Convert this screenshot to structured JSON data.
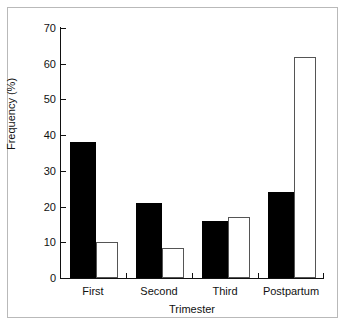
{
  "chart_data": {
    "type": "bar",
    "title": "",
    "subtitle": "",
    "xlabel": "Trimester",
    "ylabel": "Frequency (%)",
    "categories": [
      "First",
      "Second",
      "Third",
      "Postpartum"
    ],
    "series": [
      {
        "name": "filled",
        "style": "solid-black",
        "values": [
          38,
          21,
          16,
          24
        ]
      },
      {
        "name": "open",
        "style": "open-white",
        "values": [
          10,
          8.5,
          17,
          62
        ]
      }
    ],
    "ylim": [
      0,
      70
    ],
    "y_ticks": [
      0,
      10,
      20,
      30,
      40,
      50,
      60,
      70
    ],
    "y_tick_labels": [
      "0",
      "10",
      "20",
      "30",
      "40",
      "50",
      "60",
      "70"
    ],
    "grid": false,
    "legend": "none",
    "axis_style": "left-and-bottom-spines-with-inward-ticks"
  },
  "figure": {
    "border_color": "#b9b9b9",
    "axis_color": "#111111",
    "bar_fill_color": "#000000",
    "bar_open_color": "#ffffff",
    "bar_open_edge_color": "#555555",
    "background_color": "#ffffff"
  }
}
